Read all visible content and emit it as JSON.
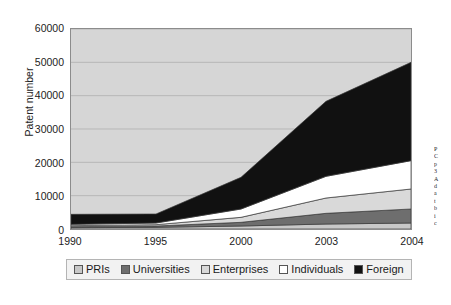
{
  "chart_data": {
    "type": "area",
    "stacked": true,
    "title": "",
    "xlabel": "",
    "ylabel": "Patent number",
    "categories": [
      "1990",
      "1995",
      "2000",
      "2003",
      "2004"
    ],
    "ylim": [
      0,
      60000
    ],
    "yticks": [
      0,
      10000,
      20000,
      30000,
      40000,
      50000,
      60000
    ],
    "ytick_labels": [
      "0",
      "10000",
      "20000",
      "30000",
      "40000",
      "50000",
      "60000"
    ],
    "grid": true,
    "legend_position": "bottom",
    "series": [
      {
        "name": "PRIs",
        "color": "#c8c8c8",
        "values": [
          400,
          500,
          900,
          1500,
          1800
        ]
      },
      {
        "name": "Universities",
        "color": "#6e6e6e",
        "values": [
          300,
          400,
          1100,
          3200,
          4200
        ]
      },
      {
        "name": "Enterprises",
        "color": "#d9d9d9",
        "values": [
          300,
          400,
          1500,
          4600,
          6000
        ]
      },
      {
        "name": "Individuals",
        "color": "#ffffff",
        "values": [
          400,
          500,
          2500,
          6500,
          8500
        ]
      },
      {
        "name": "Foreign",
        "color": "#111111",
        "values": [
          3000,
          2700,
          9500,
          22500,
          29500
        ]
      }
    ],
    "series_totals": [
      4400,
      4500,
      15500,
      38300,
      50000
    ]
  },
  "legend": {
    "items": [
      {
        "label": "PRIs"
      },
      {
        "label": "Universities"
      },
      {
        "label": "Enterprises"
      },
      {
        "label": "Individuals"
      },
      {
        "label": "Foreign"
      }
    ]
  },
  "margin_bleed": {
    "lines": [
      "P",
      "C",
      "p",
      "3",
      "A",
      "d",
      "a",
      "t",
      "b",
      "i",
      "c"
    ]
  }
}
